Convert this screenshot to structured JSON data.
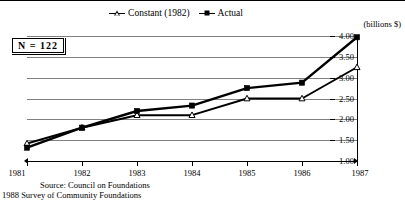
{
  "figure": {
    "units_label": "(billions $)",
    "annotation_box": "N = 122",
    "source_line1": "Source: Council on Foundations",
    "source_line2": "1988 Survey of Community Foundations"
  },
  "legend": {
    "items": [
      {
        "label": "Constant (1982)",
        "marker": "triangle-open-marker"
      },
      {
        "label": "Actual",
        "marker": "square-filled-marker"
      }
    ]
  },
  "axes": {
    "y_ticks": [
      "4.00",
      "3.50",
      "3.00",
      "2.50",
      "2.00",
      "1.50",
      "1.00"
    ],
    "x_ticks": [
      "1981",
      "1982",
      "1983",
      "1984",
      "1985",
      "1986",
      "1987"
    ]
  },
  "chart_data": {
    "type": "line",
    "title": "",
    "subtitle": "",
    "xlabel": "",
    "ylabel": "(billions $)",
    "categories": [
      "1981",
      "1982",
      "1983",
      "1984",
      "1985",
      "1986",
      "1987"
    ],
    "x": [
      1981,
      1982,
      1983,
      1984,
      1985,
      1986,
      1987
    ],
    "ylim": [
      1.0,
      4.0
    ],
    "ytick_values": [
      1.0,
      1.5,
      2.0,
      2.5,
      3.0,
      3.5,
      4.0
    ],
    "grid": true,
    "legend_position": "top-center",
    "annotations": [
      "N = 122"
    ],
    "series": [
      {
        "name": "Constant (1982)",
        "marker": "triangle-open",
        "values": [
          1.42,
          1.8,
          2.1,
          2.1,
          2.5,
          2.5,
          3.25
        ]
      },
      {
        "name": "Actual",
        "marker": "square-filled",
        "values": [
          1.32,
          1.8,
          2.2,
          2.33,
          2.75,
          2.88,
          3.97
        ]
      }
    ]
  }
}
